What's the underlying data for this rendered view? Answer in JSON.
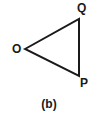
{
  "figure": {
    "caption": "(b)",
    "shape_name": "triangle",
    "stroke_color": "#1a1a1a",
    "background_color": "#ffffff",
    "stroke_width": 2,
    "vertices": [
      {
        "id": "O",
        "label": "O",
        "x": 25,
        "y": 49
      },
      {
        "id": "Q",
        "label": "Q",
        "x": 79,
        "y": 19
      },
      {
        "id": "P",
        "label": "P",
        "x": 79,
        "y": 76
      }
    ],
    "edges": [
      {
        "from": "O",
        "to": "Q"
      },
      {
        "from": "Q",
        "to": "P"
      },
      {
        "from": "P",
        "to": "O"
      }
    ]
  }
}
